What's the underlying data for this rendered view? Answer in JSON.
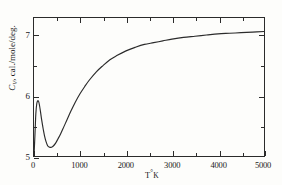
{
  "chart_data": {
    "type": "line",
    "title": "",
    "xlabel": "T °K",
    "ylabel": "C_V, cal./mole/deg.",
    "xlim": [
      0,
      5000
    ],
    "ylim": [
      5,
      7.35
    ],
    "grid": false,
    "legend": "none",
    "x_ticks_major": [
      0,
      1000,
      2000,
      3000,
      4000,
      5000
    ],
    "x_ticklabels": [
      "0",
      "1000",
      "2000",
      "3000",
      "4000",
      "5000"
    ],
    "x_ticks_minor": [
      500,
      1500,
      2500,
      3500,
      4500
    ],
    "y_ticks_major": [
      5,
      6,
      7
    ],
    "y_ticklabels": [
      "5",
      "6",
      "7"
    ],
    "y_ticks_minor": [
      5.5,
      6.5
    ],
    "series": [
      {
        "name": "Cv",
        "color": "#2b2b2b",
        "x": [
          0,
          20,
          40,
          60,
          80,
          100,
          120,
          140,
          160,
          180,
          200,
          230,
          260,
          300,
          340,
          380,
          420,
          470,
          520,
          580,
          650,
          720,
          800,
          900,
          1000,
          1100,
          1200,
          1350,
          1500,
          1650,
          1800,
          2000,
          2200,
          2400,
          2600,
          2800,
          3000,
          3250,
          3500,
          3750,
          4000,
          4250,
          4500,
          4750,
          5000
        ],
        "y": [
          5.0,
          5.35,
          5.72,
          5.89,
          5.94,
          5.93,
          5.86,
          5.76,
          5.65,
          5.55,
          5.46,
          5.34,
          5.25,
          5.17,
          5.15,
          5.15,
          5.17,
          5.22,
          5.29,
          5.38,
          5.5,
          5.62,
          5.76,
          5.92,
          6.06,
          6.18,
          6.29,
          6.43,
          6.54,
          6.64,
          6.71,
          6.79,
          6.85,
          6.9,
          6.93,
          6.96,
          6.99,
          7.02,
          7.04,
          7.06,
          7.08,
          7.09,
          7.1,
          7.11,
          7.12
        ],
        "annotation_peak": {
          "x": 90,
          "y": 5.94
        },
        "annotation_min": {
          "x": 360,
          "y": 5.15
        }
      }
    ]
  },
  "axes": {
    "x_title_main": "T",
    "x_title_degree": "°",
    "x_title_unit": "K",
    "y_title_symbol": "C",
    "y_title_sub": "V",
    "y_title_units": ", cal./mole/deg."
  }
}
